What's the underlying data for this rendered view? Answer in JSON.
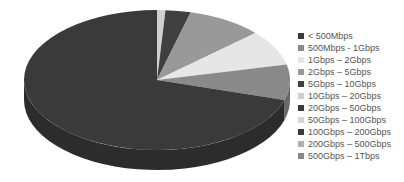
{
  "chart_data": {
    "type": "pie",
    "style": "3d",
    "title": "",
    "categories": [
      "< 500Mbps",
      "500Mbps - 1Gbps",
      "1Gbps – 2Gbps",
      "2Gbps – 5Gbps",
      "5Gbps – 10Gbps",
      "10Gbps – 20Gbps",
      "20Gbps – 50Gbps",
      "50Gbps – 100Gbps",
      "100Gbps – 200Gbps",
      "200Gbps – 500Gbps",
      "500Gbps – 1Tbps"
    ],
    "values": [
      69,
      8,
      8,
      9,
      3,
      1,
      0,
      0,
      0,
      0,
      0
    ],
    "value_unit": "approx. % of total (estimated from slice angles)",
    "colors": [
      "#3a3a3a",
      "#8a8a8a",
      "#e6e6e6",
      "#999999",
      "#404040",
      "#cfcfcf",
      "#3a3a3a",
      "#d6d6d6",
      "#3a3a3a",
      "#b0b0b0",
      "#888888"
    ],
    "legend_position": "right"
  },
  "legend": {
    "items": [
      {
        "label": "< 500Mbps",
        "color": "#3a3a3a"
      },
      {
        "label": "500Mbps - 1Gbps",
        "color": "#8a8a8a"
      },
      {
        "label": "1Gbps – 2Gbps",
        "color": "#e6e6e6"
      },
      {
        "label": "2Gbps – 5Gbps",
        "color": "#999999"
      },
      {
        "label": "5Gbps – 10Gbps",
        "color": "#404040"
      },
      {
        "label": "10Gbps – 20Gbps",
        "color": "#cfcfcf"
      },
      {
        "label": "20Gbps – 50Gbps",
        "color": "#3a3a3a"
      },
      {
        "label": "50Gbps – 100Gbps",
        "color": "#d6d6d6"
      },
      {
        "label": "100Gbps – 200Gbps",
        "color": "#3a3a3a"
      },
      {
        "label": "200Gbps – 500Gbps",
        "color": "#b0b0b0"
      },
      {
        "label": "500Gbps – 1Tbps",
        "color": "#888888"
      }
    ]
  }
}
